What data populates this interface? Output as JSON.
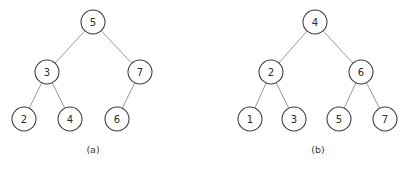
{
  "figure": {
    "background_color": "#ffffff",
    "node_stroke_color": "#3a3a3a",
    "node_fill_color": "#ffffff",
    "edge_stroke_color": "#8d8d8d",
    "text_color": "#2b2b2b",
    "node_radius": 12
  },
  "subfigures": [
    {
      "caption": "(a)",
      "caption_x": 93,
      "caption_y": 149,
      "nodes": [
        {
          "id": "a-root",
          "label": "5",
          "x": 93,
          "y": 22
        },
        {
          "id": "a-n3",
          "label": "3",
          "x": 47,
          "y": 72
        },
        {
          "id": "a-n7",
          "label": "7",
          "x": 140,
          "y": 72
        },
        {
          "id": "a-n2",
          "label": "2",
          "x": 24,
          "y": 119
        },
        {
          "id": "a-n4",
          "label": "4",
          "x": 70,
          "y": 119
        },
        {
          "id": "a-n6",
          "label": "6",
          "x": 117,
          "y": 119
        }
      ],
      "edges": [
        {
          "from": "a-root",
          "to": "a-n3"
        },
        {
          "from": "a-root",
          "to": "a-n7"
        },
        {
          "from": "a-n3",
          "to": "a-n2"
        },
        {
          "from": "a-n3",
          "to": "a-n4"
        },
        {
          "from": "a-n7",
          "to": "a-n6"
        }
      ]
    },
    {
      "caption": "(b)",
      "caption_x": 318,
      "caption_y": 149,
      "nodes": [
        {
          "id": "b-root",
          "label": "4",
          "x": 315,
          "y": 22
        },
        {
          "id": "b-n2",
          "label": "2",
          "x": 271,
          "y": 72
        },
        {
          "id": "b-n6",
          "label": "6",
          "x": 361,
          "y": 72
        },
        {
          "id": "b-n1",
          "label": "1",
          "x": 250,
          "y": 119
        },
        {
          "id": "b-n3",
          "label": "3",
          "x": 294,
          "y": 119
        },
        {
          "id": "b-n5",
          "label": "5",
          "x": 339,
          "y": 119
        },
        {
          "id": "b-n7",
          "label": "7",
          "x": 385,
          "y": 119
        }
      ],
      "edges": [
        {
          "from": "b-root",
          "to": "b-n2"
        },
        {
          "from": "b-root",
          "to": "b-n6"
        },
        {
          "from": "b-n2",
          "to": "b-n1"
        },
        {
          "from": "b-n2",
          "to": "b-n3"
        },
        {
          "from": "b-n6",
          "to": "b-n5"
        },
        {
          "from": "b-n6",
          "to": "b-n7"
        }
      ]
    }
  ]
}
